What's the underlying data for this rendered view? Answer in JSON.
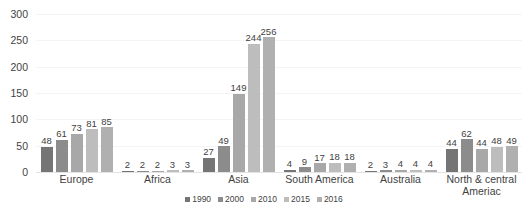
{
  "chart_data": {
    "type": "bar",
    "title": "",
    "subtitle": "",
    "xlabel": "",
    "ylabel": "",
    "ylim": [
      0,
      300
    ],
    "yticks": [
      0,
      50,
      100,
      150,
      200,
      250,
      300
    ],
    "grid": true,
    "legend_position": "bottom",
    "categories": [
      "Europe",
      "Africa",
      "Asia",
      "South America",
      "Australia",
      "North & central Ameriac"
    ],
    "series": [
      {
        "name": "1990",
        "color": "#757575",
        "values": [
          48,
          2,
          27,
          4,
          2,
          44
        ]
      },
      {
        "name": "2000",
        "color": "#8c8c8c",
        "values": [
          61,
          2,
          49,
          9,
          3,
          62
        ]
      },
      {
        "name": "2010",
        "color": "#a8a8a8",
        "values": [
          73,
          2,
          149,
          17,
          4,
          44
        ]
      },
      {
        "name": "2015",
        "color": "#bdbdbd",
        "values": [
          81,
          3,
          244,
          18,
          4,
          48
        ]
      },
      {
        "name": "2016",
        "color": "#b0b0b0",
        "values": [
          85,
          3,
          256,
          18,
          4,
          49
        ]
      }
    ]
  },
  "axis": {
    "y_tick_labels": [
      "300",
      "250",
      "200",
      "150",
      "100",
      "50",
      "0"
    ]
  },
  "legend": {
    "items": [
      {
        "label": "1990"
      },
      {
        "label": "2000"
      },
      {
        "label": "2010"
      },
      {
        "label": "2015"
      },
      {
        "label": "2016"
      }
    ]
  }
}
